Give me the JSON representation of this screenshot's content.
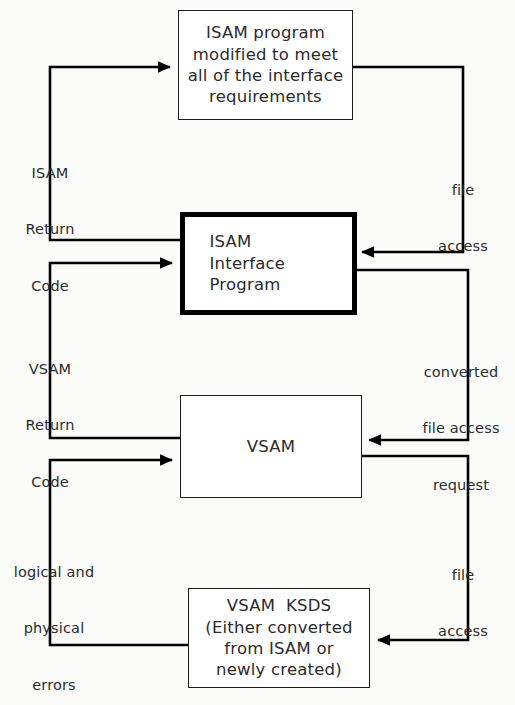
{
  "diagram": {
    "type": "flowchart",
    "background_color": "#fbfbfa",
    "line_color": "#000000",
    "text_color": "#2b2b2b",
    "nodes": [
      {
        "id": "isam-program",
        "label": "ISAM program\nmodified to meet\nall of the interface\nrequirements",
        "lines": [
          "ISAM program",
          "modified to meet",
          "all of the interface",
          "requirements"
        ],
        "border": "thin"
      },
      {
        "id": "isam-interface-program",
        "label": "ISAM\nInterface\nProgram",
        "lines": [
          "ISAM",
          "Interface",
          "Program"
        ],
        "border": "thick"
      },
      {
        "id": "vsam",
        "label": "VSAM",
        "lines": [
          "VSAM"
        ],
        "border": "thin"
      },
      {
        "id": "vsam-ksds",
        "label": "VSAM KSDS\n(Either converted\nfrom ISAM or\nnewly created)",
        "lines": [
          "VSAM  KSDS",
          "(Either converted",
          "from ISAM or",
          "newly created)"
        ],
        "border": "thin"
      }
    ],
    "edge_labels": [
      {
        "id": "isam-return-code",
        "side": "left",
        "lines": [
          "ISAM",
          "Return",
          "Code"
        ],
        "text": "ISAM Return Code"
      },
      {
        "id": "vsam-return-code",
        "side": "left",
        "lines": [
          "VSAM",
          "Return",
          "Code"
        ],
        "text": "VSAM Return Code"
      },
      {
        "id": "logical-and-physical-errors",
        "side": "left",
        "lines": [
          "logical and",
          "physical",
          "errors"
        ],
        "text": "logical and physical errors"
      },
      {
        "id": "file-access-top",
        "side": "right",
        "lines": [
          "file",
          "access"
        ],
        "text": "file access"
      },
      {
        "id": "converted-file-access-request",
        "side": "right",
        "lines": [
          "converted",
          "file access",
          "request"
        ],
        "text": "converted file access request"
      },
      {
        "id": "file-access-bottom",
        "side": "right",
        "lines": [
          "file",
          "access"
        ],
        "text": "file access"
      }
    ]
  }
}
